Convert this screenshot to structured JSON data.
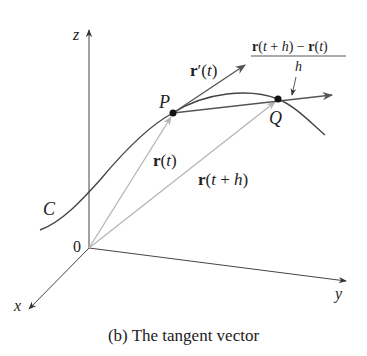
{
  "figure": {
    "caption": "(b) The tangent vector",
    "axes": {
      "z": "z",
      "x": "x",
      "y": "y",
      "origin": "0"
    },
    "curve_label": "C",
    "points": {
      "P": "P",
      "Q": "Q"
    },
    "vectors": {
      "r_t": "r(t)",
      "r_t_h": "r(t + h)",
      "r_prime": "r′(t)",
      "difference_quotient_numerator": "r(t + h) − r(t)",
      "difference_quotient_denominator": "h"
    },
    "colors": {
      "axis": "#333333",
      "curve": "#444444",
      "position_vectors": "#b5b5b5",
      "tangent_and_secant": "#555555",
      "points": "#111111"
    }
  }
}
